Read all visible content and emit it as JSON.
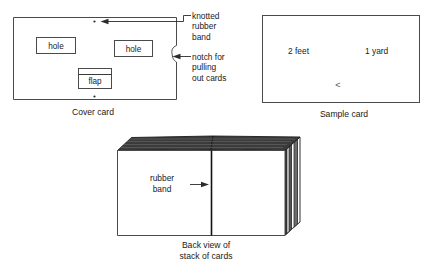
{
  "figure": {
    "title_alt": "Diagram of cover card, sample card and stack of cards"
  },
  "cover_card": {
    "caption": "Cover card",
    "hole_left_label": "hole",
    "hole_right_label": "hole",
    "flap_label": "flap"
  },
  "annotations": {
    "knotted_rubber_band": "knotted\nrubber\nband",
    "knotted_rubber_band_lines": [
      "knotted",
      "rubber",
      "band"
    ],
    "notch": "notch for\npulling\nout cards",
    "notch_lines": [
      "notch for",
      "pulling",
      "out cards"
    ]
  },
  "sample_card": {
    "caption": "Sample card",
    "left_text": "2 feet",
    "right_text": "1 yard",
    "comparison_symbol": "<"
  },
  "stack": {
    "caption_lines": [
      "Back view of",
      "stack of cards"
    ],
    "band_label_lines": [
      "rubber",
      "band"
    ]
  },
  "colors": {
    "background": "#ffffff",
    "ink": "#1a1a1a",
    "card_stroke": "#4a4a4a",
    "edge_dark": "#2a2a2a"
  }
}
